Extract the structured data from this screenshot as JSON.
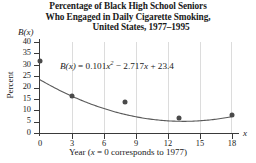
{
  "title": {
    "line1": "Percentage of Black High School Seniors",
    "line2": "Who Engaged in Daily Cigarette Smoking,",
    "line3": "United States, 1977–1995"
  },
  "axes": {
    "y_axis_name": "B(x)",
    "y_axis_label": "Percent",
    "x_axis_name": "x",
    "x_caption_prefix": "Year (",
    "x_caption_var": "x",
    "x_caption_suffix": " = 0 corresponds to 1977)",
    "x_caption_full": "Year (x = 0 corresponds to 1977)"
  },
  "equation": {
    "lhs": "B(x)",
    "eq": " = ",
    "coef_a": "0.101",
    "term_a_var": "x",
    "term_a_exp": "2",
    "sign_b": " − ",
    "coef_b": "2.717",
    "term_b_var": "x",
    "sign_c": " + ",
    "coef_c": "23.4",
    "full": "B(x) = 0.101x² − 2.717x + 23.4"
  },
  "colors": {
    "axis": "#3a3a3a",
    "grid": "#dcdcdc",
    "point": "#4a4a4a",
    "curve": "#5a5a5a",
    "background": "#ffffff"
  },
  "chart_data": {
    "type": "scatter",
    "title": "Percentage of Black High School Seniors Who Engaged in Daily Cigarette Smoking, United States, 1977–1995",
    "xlabel": "Year (x = 0 corresponds to 1977)",
    "ylabel": "Percent",
    "xlim": [
      0,
      18
    ],
    "ylim": [
      0,
      40
    ],
    "xticks": [
      0,
      3,
      6,
      9,
      12,
      15,
      18
    ],
    "yticks": [
      0,
      5,
      10,
      15,
      20,
      25,
      30,
      35,
      40
    ],
    "grid": "vertical",
    "legend": "none",
    "points": [
      {
        "x": 0,
        "y": 31.6
      },
      {
        "x": 3,
        "y": 16.2
      },
      {
        "x": 8,
        "y": 13.6
      },
      {
        "x": 13,
        "y": 6.6
      },
      {
        "x": 18,
        "y": 8.0
      }
    ],
    "series": [
      {
        "name": "Daily cigarette smoking (%)",
        "kind": "scatter",
        "x": [
          0,
          3,
          8,
          13,
          18
        ],
        "values": [
          31.6,
          16.2,
          13.6,
          6.6,
          8.0
        ]
      },
      {
        "name": "B(x) = 0.101x² − 2.717x + 23.4",
        "kind": "line",
        "annotation": "B(x) = 0.101x² − 2.717x + 23.4",
        "x": [
          0,
          2,
          4,
          6,
          8,
          10,
          12,
          14,
          16,
          18
        ],
        "values": [
          23.4,
          18.37,
          14.15,
          10.73,
          12.12,
          6.33,
          5.35,
          5.18,
          5.81,
          7.26
        ]
      }
    ]
  },
  "ytick_labels": [
    "40",
    "35",
    "30",
    "25",
    "20",
    "15",
    "10",
    "5",
    "0"
  ],
  "xtick_labels": [
    "0",
    "3",
    "6",
    "9",
    "12",
    "15",
    "18"
  ]
}
